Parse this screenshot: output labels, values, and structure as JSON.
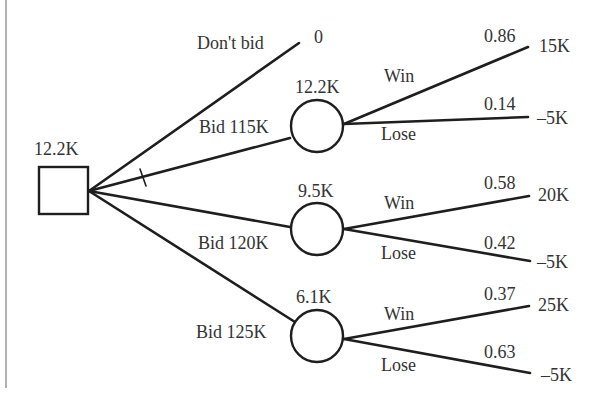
{
  "diagram": {
    "type": "decision-tree",
    "root": {
      "shape": "square",
      "value": "12.2K",
      "branches": [
        {
          "label": "Don't bid",
          "payoff": "0",
          "chosen": false
        },
        {
          "label": "Bid 115K",
          "chosen": true,
          "node": {
            "shape": "circle",
            "value": "12.2K",
            "outcomes": [
              {
                "label": "Win",
                "prob": "0.86",
                "payoff": "15K"
              },
              {
                "label": "Lose",
                "prob": "0.14",
                "payoff": "–5K"
              }
            ]
          }
        },
        {
          "label": "Bid 120K",
          "chosen": false,
          "node": {
            "shape": "circle",
            "value": "9.5K",
            "outcomes": [
              {
                "label": "Win",
                "prob": "0.58",
                "payoff": "20K"
              },
              {
                "label": "Lose",
                "prob": "0.42",
                "payoff": "–5K"
              }
            ]
          }
        },
        {
          "label": "Bid 125K",
          "chosen": false,
          "node": {
            "shape": "circle",
            "value": "6.1K",
            "outcomes": [
              {
                "label": "Win",
                "prob": "0.37",
                "payoff": "25K"
              },
              {
                "label": "Lose",
                "prob": "0.63",
                "payoff": "–5K"
              }
            ]
          }
        }
      ]
    }
  },
  "labels": {
    "root_value": "12.2K",
    "dont_bid": "Don't bid",
    "dont_bid_payoff": "0",
    "bid1": "Bid 115K",
    "bid1_value": "12.2K",
    "bid1_win": "Win",
    "bid1_win_prob": "0.86",
    "bid1_win_payoff": "15K",
    "bid1_lose": "Lose",
    "bid1_lose_prob": "0.14",
    "bid1_lose_payoff": "–5K",
    "bid2": "Bid 120K",
    "bid2_value": "9.5K",
    "bid2_win": "Win",
    "bid2_win_prob": "0.58",
    "bid2_win_payoff": "20K",
    "bid2_lose": "Lose",
    "bid2_lose_prob": "0.42",
    "bid2_lose_payoff": "–5K",
    "bid3": "Bid 125K",
    "bid3_value": "6.1K",
    "bid3_win": "Win",
    "bid3_win_prob": "0.37",
    "bid3_win_payoff": "25K",
    "bid3_lose": "Lose",
    "bid3_lose_prob": "0.63",
    "bid3_lose_payoff": "–5K"
  }
}
